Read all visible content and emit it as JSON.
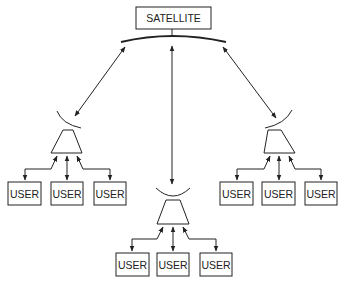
{
  "diagram": {
    "satellite": {
      "label": "SATELLITE"
    },
    "stations": [
      {
        "id": "left",
        "users": [
          "USER",
          "USER",
          "USER"
        ]
      },
      {
        "id": "center",
        "users": [
          "USER",
          "USER",
          "USER"
        ]
      },
      {
        "id": "right",
        "users": [
          "USER",
          "USER",
          "USER"
        ]
      }
    ],
    "colors": {
      "stroke": "#222222",
      "background": "#ffffff"
    }
  }
}
